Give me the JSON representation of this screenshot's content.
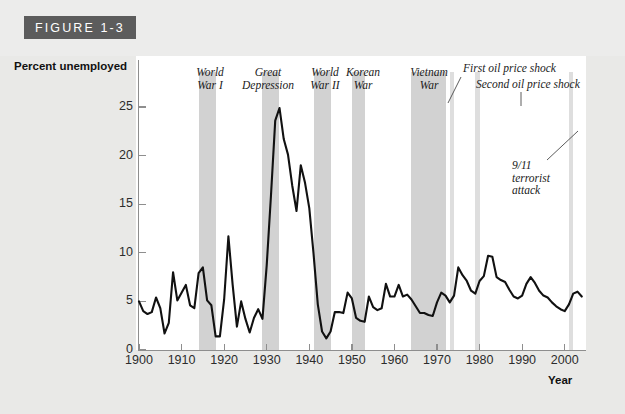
{
  "figure": {
    "tag": "FIGURE 1-3"
  },
  "chart_data": {
    "type": "line",
    "title": "FIGURE 1-3",
    "xlabel": "Year",
    "ylabel": "Percent unemployed",
    "xlim": [
      1900,
      2005
    ],
    "ylim": [
      0,
      27
    ],
    "grid": false,
    "legend": "none",
    "y_ticks": [
      0,
      5,
      10,
      15,
      20,
      25
    ],
    "y_tick_labels": [
      "0",
      "5",
      "10",
      "15",
      "20",
      "25"
    ],
    "x_ticks": [
      1900,
      1910,
      1920,
      1930,
      1940,
      1950,
      1960,
      1970,
      1980,
      1990,
      2000
    ],
    "x_tick_labels": [
      "1900",
      "1910",
      "1920",
      "1930",
      "1940",
      "1950",
      "1960",
      "1970",
      "1980",
      "1990",
      "2000"
    ],
    "series": [
      {
        "name": "Percent unemployed",
        "color": "#111111",
        "x": [
          1900,
          1901,
          1902,
          1903,
          1904,
          1905,
          1906,
          1907,
          1908,
          1909,
          1910,
          1911,
          1912,
          1913,
          1914,
          1915,
          1916,
          1917,
          1918,
          1919,
          1920,
          1921,
          1922,
          1923,
          1924,
          1925,
          1926,
          1927,
          1928,
          1929,
          1930,
          1931,
          1932,
          1933,
          1934,
          1935,
          1936,
          1937,
          1938,
          1939,
          1940,
          1941,
          1942,
          1943,
          1944,
          1945,
          1946,
          1947,
          1948,
          1949,
          1950,
          1951,
          1952,
          1953,
          1954,
          1955,
          1956,
          1957,
          1958,
          1959,
          1960,
          1961,
          1962,
          1963,
          1964,
          1965,
          1966,
          1967,
          1968,
          1969,
          1970,
          1971,
          1972,
          1973,
          1974,
          1975,
          1976,
          1977,
          1978,
          1979,
          1980,
          1981,
          1982,
          1983,
          1984,
          1985,
          1986,
          1987,
          1988,
          1989,
          1990,
          1991,
          1992,
          1993,
          1994,
          1995,
          1996,
          1997,
          1998,
          1999,
          2000,
          2001,
          2002,
          2003,
          2004
        ],
        "values": [
          5.0,
          4.0,
          3.7,
          3.9,
          5.4,
          4.3,
          1.7,
          2.8,
          8.0,
          5.1,
          5.9,
          6.7,
          4.6,
          4.3,
          7.9,
          8.5,
          5.1,
          4.6,
          1.4,
          1.4,
          5.2,
          11.7,
          6.7,
          2.4,
          5.0,
          3.2,
          1.8,
          3.3,
          4.2,
          3.2,
          8.7,
          15.9,
          23.6,
          24.9,
          21.7,
          20.1,
          16.9,
          14.3,
          19.0,
          17.2,
          14.6,
          9.9,
          4.7,
          1.9,
          1.2,
          1.9,
          3.9,
          3.9,
          3.8,
          5.9,
          5.3,
          3.3,
          3.0,
          2.9,
          5.5,
          4.4,
          4.1,
          4.3,
          6.8,
          5.5,
          5.5,
          6.7,
          5.5,
          5.7,
          5.2,
          4.5,
          3.8,
          3.8,
          3.6,
          3.5,
          4.9,
          5.9,
          5.6,
          4.9,
          5.6,
          8.5,
          7.7,
          7.1,
          6.1,
          5.8,
          7.1,
          7.6,
          9.7,
          9.6,
          7.5,
          7.2,
          7.0,
          6.2,
          5.5,
          5.3,
          5.6,
          6.8,
          7.5,
          6.9,
          6.1,
          5.6,
          5.4,
          4.9,
          4.5,
          4.2,
          4.0,
          4.7,
          5.8,
          6.0,
          5.5
        ]
      }
    ],
    "event_bands": [
      {
        "name": "World War I",
        "label": "World\nWar I",
        "start": 1914,
        "end": 1918,
        "shade": "dark",
        "label_x": 187,
        "label_y": 66,
        "label_w": 46,
        "label_align": "center"
      },
      {
        "name": "Great Depression",
        "label": "Great\nDepression",
        "start": 1929,
        "end": 1933,
        "shade": "dark",
        "label_x": 237,
        "label_y": 66,
        "label_w": 62,
        "label_align": "center"
      },
      {
        "name": "World War II",
        "label": "World\nWar II",
        "start": 1941,
        "end": 1945,
        "shade": "dark",
        "label_x": 302,
        "label_y": 66,
        "label_w": 46,
        "label_align": "center"
      },
      {
        "name": "Korean War",
        "label": "Korean\nWar",
        "start": 1950,
        "end": 1953,
        "shade": "dark",
        "label_x": 340,
        "label_y": 66,
        "label_w": 46,
        "label_align": "center"
      },
      {
        "name": "Vietnam War",
        "label": "Vietnam\nWar",
        "start": 1964,
        "end": 1972,
        "shade": "dark",
        "label_x": 404,
        "label_y": 66,
        "label_w": 50,
        "label_align": "center"
      },
      {
        "name": "First oil price shock",
        "label": "First oil price shock",
        "start": 1973,
        "end": 1974,
        "shade": "light",
        "label_x": 463,
        "label_y": 62,
        "label_w": 130,
        "label_align": "left"
      },
      {
        "name": "Second oil price shock",
        "label": "Second oil price shock",
        "start": 1979,
        "end": 1980,
        "shade": "light",
        "label_x": 476,
        "label_y": 78,
        "label_w": 145,
        "label_align": "left"
      },
      {
        "name": "9/11 terrorist attack",
        "label": "9/11\nterrorist\nattack",
        "start": 2001,
        "end": 2002,
        "shade": "light",
        "label_x": 512,
        "label_y": 159,
        "label_w": 70,
        "label_align": "left"
      }
    ],
    "annotations": [
      {
        "name": "first-oil-shock-leader",
        "from": [
          461,
          77
        ],
        "to": [
          448,
          103
        ]
      },
      {
        "name": "second-oil-shock-leader",
        "from": [
          521,
          92
        ],
        "to": [
          521,
          106
        ]
      },
      {
        "name": "terrorist-attack-leader",
        "from": [
          578,
          131
        ],
        "to": [
          547,
          160
        ]
      }
    ]
  }
}
